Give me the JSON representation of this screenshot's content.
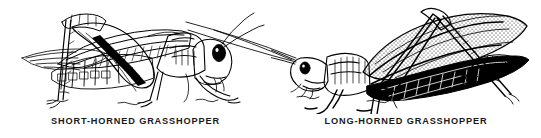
{
  "plate": {
    "title": "Grasshopper comparison plate",
    "background_color": "#ffffff",
    "ink_color": "#000000",
    "style": "black-and-white pen-and-ink line drawing"
  },
  "figures": [
    {
      "id": "short-horned",
      "caption": "SHORT-HORNED GRASSHOPPER",
      "facing": "right",
      "antennae": "short",
      "parts": [
        "antenna",
        "compound-eye",
        "head",
        "pronotum",
        "forewing",
        "hind-femur",
        "hind-tibia",
        "foreleg",
        "midleg",
        "tarsus",
        "abdomen"
      ]
    },
    {
      "id": "long-horned",
      "caption": "LONG-HORNED GRASSHOPPER",
      "facing": "left",
      "antennae": "long",
      "parts": [
        "antenna",
        "compound-eye",
        "head",
        "pronotum",
        "forewing",
        "hind-femur",
        "hind-tibia",
        "foreleg",
        "midleg",
        "tarsus",
        "abdomen"
      ]
    }
  ]
}
